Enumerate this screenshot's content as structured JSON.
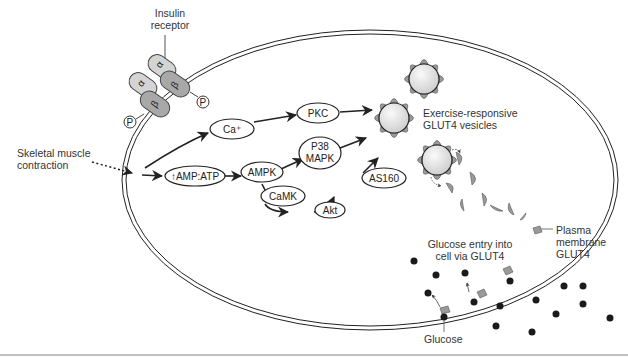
{
  "diagram": {
    "labels": {
      "insulin_receptor_line1": "Insulin",
      "insulin_receptor_line2": "receptor",
      "stimulus_line1": "Skeletal muscle",
      "stimulus_line2": "contraction",
      "vesicles_line1": "Exercise-responsive",
      "vesicles_line2": "GLUT4 vesicles",
      "plasma_glut4_line1": "Plasma",
      "plasma_glut4_line2": "membrane",
      "plasma_glut4_line3": "GLUT4",
      "glucose_entry_line1": "Glucose entry into",
      "glucose_entry_line2": "cell via GLUT4",
      "glucose": "Glucose"
    },
    "receptor_subunits": {
      "alpha": "α",
      "beta": "β",
      "phospho": "P"
    },
    "nodes": {
      "ca": "Ca⁺",
      "pkc": "PKC",
      "amp_atp": "↑AMP:ATP",
      "ampk": "AMPK",
      "p38_line1": "P38",
      "p38_line2": "MAPK",
      "camk": "CaMK",
      "akt": "Akt",
      "as160": "AS160"
    },
    "edges": [
      {
        "from": "Skeletal muscle contraction",
        "to": "↑AMP:ATP",
        "style": "dotted"
      },
      {
        "from": "start",
        "to": "Ca⁺"
      },
      {
        "from": "start",
        "to": "↑AMP:ATP"
      },
      {
        "from": "Ca⁺",
        "to": "PKC"
      },
      {
        "from": "PKC",
        "to": "GLUT4 vesicle"
      },
      {
        "from": "↑AMP:ATP",
        "to": "AMPK"
      },
      {
        "from": "AMPK",
        "to": "P38 MAPK"
      },
      {
        "from": "P38 MAPK",
        "to": "GLUT4 vesicle"
      },
      {
        "from": "AMPK",
        "to": "CaMK"
      },
      {
        "from": "CaMK",
        "to": "Akt"
      },
      {
        "from": "Akt",
        "to": "AS160"
      },
      {
        "from": "AS160",
        "to": "GLUT4 vesicle"
      }
    ],
    "colors": {
      "line": "#222222",
      "receptor_alpha": "#d4d4d4",
      "receptor_beta": "#a8a8a8",
      "vesicle_fill": "#e6e6e6",
      "glut4_fill": "#9a9a9a",
      "glucose": "#1a1a1a"
    }
  }
}
